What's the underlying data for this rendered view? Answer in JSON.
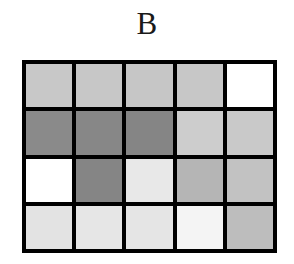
{
  "figure": {
    "panel_label": "B",
    "background_color": "#ffffff",
    "grid_line_color": "#000000",
    "grid_line_width_px": 4
  },
  "chart_data": {
    "type": "heatmap",
    "title": "B",
    "subtitle": "",
    "xlabel": "",
    "ylabel": "",
    "rows": 4,
    "columns": 5,
    "grid": true,
    "legend": "none",
    "colormap": "grayscale",
    "value_range": [
      0,
      1
    ],
    "note": "Values are normalized grayscale levels; 0 = black, 1 = white.",
    "row_labels": [
      "1",
      "2",
      "3",
      "4"
    ],
    "column_labels": [
      "1",
      "2",
      "3",
      "4",
      "5"
    ],
    "values": [
      [
        0.78,
        0.78,
        0.78,
        0.78,
        1.0
      ],
      [
        0.54,
        0.53,
        0.52,
        0.8,
        0.79
      ],
      [
        1.0,
        0.52,
        0.91,
        0.71,
        0.76
      ],
      [
        0.89,
        0.9,
        0.9,
        0.96,
        0.74
      ]
    ],
    "cell_colors": [
      [
        "#c8c8c8",
        "#c7c7c7",
        "#c6c6c6",
        "#c7c7c7",
        "#ffffff"
      ],
      [
        "#8a8a8a",
        "#878787",
        "#858585",
        "#cdcdcd",
        "#c9c9c9"
      ],
      [
        "#ffffff",
        "#858585",
        "#e8e8e8",
        "#b5b5b5",
        "#c2c2c2"
      ],
      [
        "#e3e3e3",
        "#e6e6e6",
        "#e5e5e5",
        "#f4f4f4",
        "#bdbdbd"
      ]
    ],
    "cells": [
      {
        "row": 1,
        "col": 1,
        "color": "#c8c8c8",
        "value": 0.78
      },
      {
        "row": 1,
        "col": 2,
        "color": "#c7c7c7",
        "value": 0.78
      },
      {
        "row": 1,
        "col": 3,
        "color": "#c6c6c6",
        "value": 0.78
      },
      {
        "row": 1,
        "col": 4,
        "color": "#c7c7c7",
        "value": 0.78
      },
      {
        "row": 1,
        "col": 5,
        "color": "#ffffff",
        "value": 1.0
      },
      {
        "row": 2,
        "col": 1,
        "color": "#8a8a8a",
        "value": 0.54
      },
      {
        "row": 2,
        "col": 2,
        "color": "#878787",
        "value": 0.53
      },
      {
        "row": 2,
        "col": 3,
        "color": "#858585",
        "value": 0.52
      },
      {
        "row": 2,
        "col": 4,
        "color": "#cdcdcd",
        "value": 0.8
      },
      {
        "row": 2,
        "col": 5,
        "color": "#c9c9c9",
        "value": 0.79
      },
      {
        "row": 3,
        "col": 1,
        "color": "#ffffff",
        "value": 1.0
      },
      {
        "row": 3,
        "col": 2,
        "color": "#858585",
        "value": 0.52
      },
      {
        "row": 3,
        "col": 3,
        "color": "#e8e8e8",
        "value": 0.91
      },
      {
        "row": 3,
        "col": 4,
        "color": "#b5b5b5",
        "value": 0.71
      },
      {
        "row": 3,
        "col": 5,
        "color": "#c2c2c2",
        "value": 0.76
      },
      {
        "row": 4,
        "col": 1,
        "color": "#e3e3e3",
        "value": 0.89
      },
      {
        "row": 4,
        "col": 2,
        "color": "#e6e6e6",
        "value": 0.9
      },
      {
        "row": 4,
        "col": 3,
        "color": "#e5e5e5",
        "value": 0.9
      },
      {
        "row": 4,
        "col": 4,
        "color": "#f4f4f4",
        "value": 0.96
      },
      {
        "row": 4,
        "col": 5,
        "color": "#bdbdbd",
        "value": 0.74
      }
    ]
  }
}
